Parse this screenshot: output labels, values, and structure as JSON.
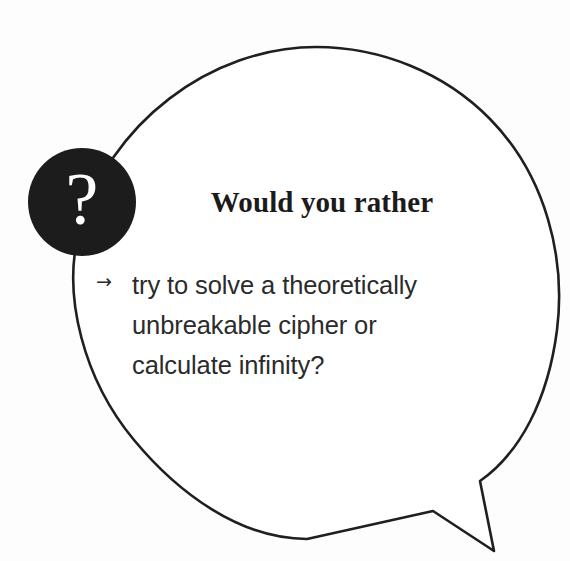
{
  "card": {
    "background_color": "#fdfdfd",
    "outline_color": "#1f1f1f"
  },
  "badge": {
    "icon_name": "question-mark-icon",
    "glyph": "?",
    "fill_color": "#1c1c1c",
    "glyph_color": "#ffffff"
  },
  "bubble": {
    "shape": "speech-bubble-ellipse-with-tail",
    "stroke_color": "#1f1f1f",
    "fill_color": "#ffffff"
  },
  "content": {
    "title": "Would you rather",
    "bullet_icon": "arrow-right-icon",
    "bullet_glyph": "→",
    "prompt": "try to solve a theoretically unbreakable cipher or calculate infinity?",
    "title_color": "#1b1b1b",
    "prompt_color": "#2b2b2b"
  }
}
